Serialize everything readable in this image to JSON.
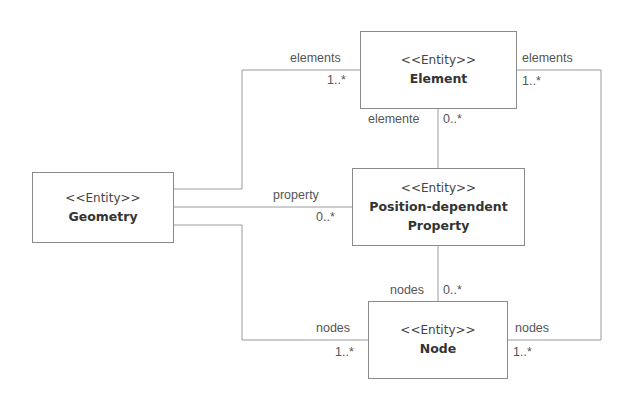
{
  "diagram": {
    "type": "UML class diagram",
    "entities": {
      "element": {
        "stereotype": "<<Entity>>",
        "name": "Element"
      },
      "geometry": {
        "stereotype": "<<Entity>>",
        "name": "Geometry"
      },
      "pdp": {
        "stereotype": "<<Entity>>",
        "name_line1": "Position-dependent",
        "name_line2": "Property"
      },
      "node": {
        "stereotype": "<<Entity>>",
        "name": "Node"
      }
    },
    "associations": {
      "geometry_element": {
        "role": "elements",
        "multiplicity": "1..*"
      },
      "node_element": {
        "role": "elements",
        "multiplicity": "1..*"
      },
      "pdp_element": {
        "role": "elemente",
        "multiplicity": "0..*"
      },
      "geometry_pdp": {
        "role": "property",
        "multiplicity": "0..*"
      },
      "pdp_node": {
        "role": "nodes",
        "multiplicity": "0..*"
      },
      "geometry_node": {
        "role": "nodes",
        "multiplicity": "1..*"
      },
      "element_node": {
        "role": "nodes",
        "multiplicity": "1..*"
      }
    },
    "line_color": "#9a9a9a"
  }
}
